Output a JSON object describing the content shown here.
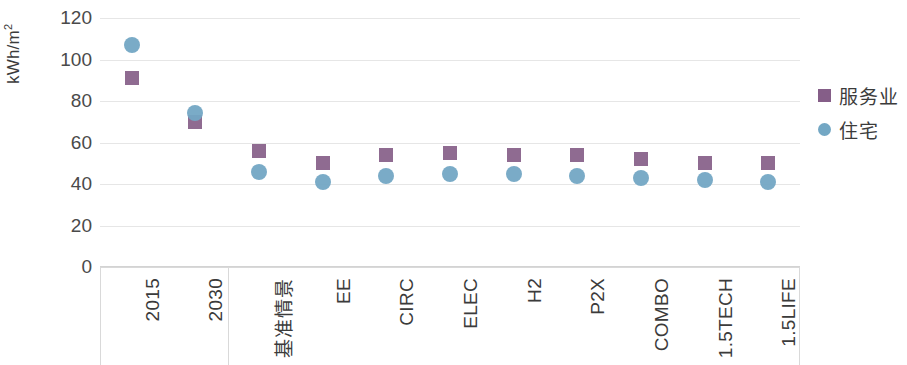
{
  "chart_data": {
    "type": "scatter",
    "title": "",
    "xlabel": "",
    "ylabel": "kWh/m²",
    "ylabel_base": "kWh/m",
    "ylabel_sup": "2",
    "ylim": [
      0,
      120
    ],
    "ytick_step": 20,
    "yticks": [
      120,
      100,
      80,
      60,
      40,
      20,
      0
    ],
    "ytick_labels": [
      "120",
      "100",
      "80",
      "60",
      "40",
      "20",
      "0"
    ],
    "grid": true,
    "grid_axis": "y",
    "legend_position": "right",
    "categories": [
      "2015",
      "2030",
      "基准情景",
      "EE",
      "CIRC",
      "ELEC",
      "H2",
      "P2X",
      "COMBO",
      "1.5TECH",
      "1.5LIFE"
    ],
    "group_divider_after_category": "2030",
    "series": [
      {
        "name": "服务业",
        "marker": "square",
        "color": "#855e88",
        "values": [
          91,
          70,
          56,
          50,
          54,
          55,
          54,
          54,
          52,
          50,
          50
        ]
      },
      {
        "name": "住宅",
        "marker": "circle",
        "color": "#73a7c4",
        "values": [
          107,
          74,
          46,
          41,
          44,
          45,
          45,
          44,
          43,
          42,
          41
        ]
      }
    ]
  },
  "legend": {
    "items": [
      {
        "label": "服务业",
        "marker": "square",
        "color": "#855e88"
      },
      {
        "label": "住宅",
        "marker": "circle",
        "color": "#73a7c4"
      }
    ]
  },
  "colors": {
    "services": "#855e88",
    "residential": "#73a7c4",
    "gridline": "#e6e6e6",
    "axis": "#d9d9d9",
    "text": "#3b3b3b"
  }
}
